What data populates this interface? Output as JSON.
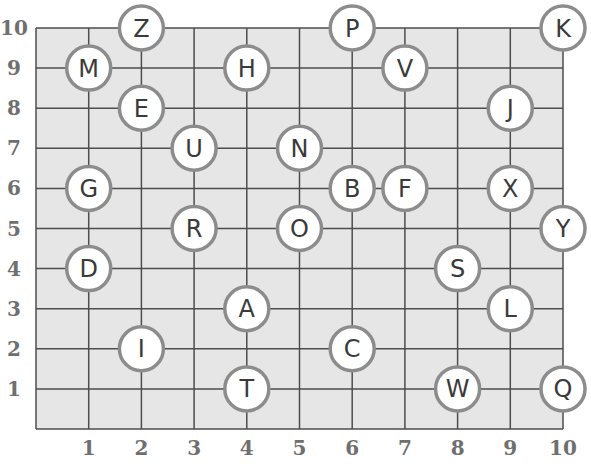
{
  "grid": {
    "x_ticks": [
      "1",
      "2",
      "3",
      "4",
      "5",
      "6",
      "7",
      "8",
      "9",
      "10"
    ],
    "y_ticks": [
      "1",
      "2",
      "3",
      "4",
      "5",
      "6",
      "7",
      "8",
      "9",
      "10"
    ],
    "colors": {
      "background": "#e6e6e6",
      "line": "#4d4d4d",
      "circle_border": "#8c8c8c",
      "label": "#6f6f6f"
    }
  },
  "points": [
    {
      "letter": "Z",
      "x": 2,
      "y": 10
    },
    {
      "letter": "P",
      "x": 6,
      "y": 10
    },
    {
      "letter": "K",
      "x": 10,
      "y": 10
    },
    {
      "letter": "M",
      "x": 1,
      "y": 9
    },
    {
      "letter": "H",
      "x": 4,
      "y": 9
    },
    {
      "letter": "V",
      "x": 7,
      "y": 9
    },
    {
      "letter": "E",
      "x": 2,
      "y": 8
    },
    {
      "letter": "J",
      "x": 9,
      "y": 8
    },
    {
      "letter": "U",
      "x": 3,
      "y": 7
    },
    {
      "letter": "N",
      "x": 5,
      "y": 7
    },
    {
      "letter": "G",
      "x": 1,
      "y": 6
    },
    {
      "letter": "B",
      "x": 6,
      "y": 6
    },
    {
      "letter": "F",
      "x": 7,
      "y": 6
    },
    {
      "letter": "X",
      "x": 9,
      "y": 6
    },
    {
      "letter": "R",
      "x": 3,
      "y": 5
    },
    {
      "letter": "O",
      "x": 5,
      "y": 5
    },
    {
      "letter": "Y",
      "x": 10,
      "y": 5
    },
    {
      "letter": "D",
      "x": 1,
      "y": 4
    },
    {
      "letter": "S",
      "x": 8,
      "y": 4
    },
    {
      "letter": "A",
      "x": 4,
      "y": 3
    },
    {
      "letter": "L",
      "x": 9,
      "y": 3
    },
    {
      "letter": "I",
      "x": 2,
      "y": 2
    },
    {
      "letter": "C",
      "x": 6,
      "y": 2
    },
    {
      "letter": "T",
      "x": 4,
      "y": 1
    },
    {
      "letter": "W",
      "x": 8,
      "y": 1
    },
    {
      "letter": "Q",
      "x": 10,
      "y": 1
    }
  ]
}
